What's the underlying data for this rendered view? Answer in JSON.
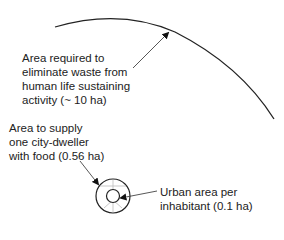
{
  "diagram": {
    "labels": {
      "waste_area": [
        "Area required to",
        "eliminate waste from",
        "human life sustaining",
        "activity (~ 10 ha)"
      ],
      "food_area": [
        "Area to supply",
        "one city-dweller",
        "with food (0.56 ha)"
      ],
      "urban_area": [
        "Urban area per",
        "inhabitant (0.1 ha)"
      ]
    },
    "values": {
      "waste_area_ha": "~ 10",
      "food_area_ha": "0.56",
      "urban_area_ha": "0.1"
    },
    "colors": {
      "line": "#222222",
      "faint": "#bbbbbb"
    }
  }
}
